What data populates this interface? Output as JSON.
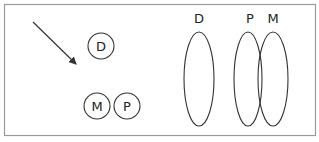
{
  "diagram": {
    "frame": {
      "stroke": "#9a9a9a"
    },
    "left_panel": {
      "arrow": {
        "from": [
          33,
          22
        ],
        "to": [
          76,
          64
        ]
      },
      "circles": [
        {
          "label": "D",
          "cx": 101,
          "cy": 46,
          "r": 13
        },
        {
          "label": "M",
          "cx": 97,
          "cy": 106,
          "r": 13
        },
        {
          "label": "P",
          "cx": 127,
          "cy": 106,
          "r": 13
        }
      ]
    },
    "right_panel": {
      "ellipses": [
        {
          "label": "D",
          "cx": 199,
          "cy": 79,
          "rx": 15,
          "ry": 47,
          "label_x": 199,
          "label_y": 23
        },
        {
          "label": "P",
          "cx": 248,
          "cy": 79,
          "rx": 14,
          "ry": 47,
          "label_x": 250,
          "label_y": 23
        },
        {
          "label": "M",
          "cx": 273,
          "cy": 79,
          "rx": 15,
          "ry": 47,
          "label_x": 273,
          "label_y": 23
        }
      ]
    },
    "stroke_color": "#333333"
  }
}
